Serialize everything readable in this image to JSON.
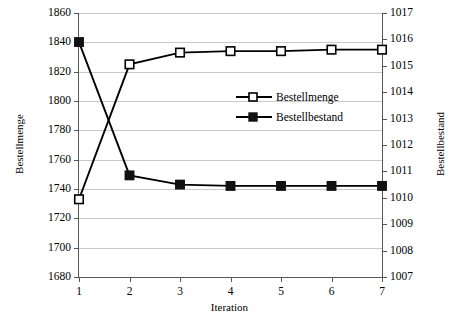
{
  "chart_data": {
    "type": "line",
    "title": "",
    "xlabel": "Iteration",
    "ylabel": "Bestellmenge",
    "y2label": "Bestellbestand",
    "x": [
      1,
      2,
      3,
      4,
      5,
      6,
      7
    ],
    "xtick_labels": [
      "1",
      "2",
      "3",
      "4",
      "5",
      "6",
      "7"
    ],
    "xlim": [
      1,
      7
    ],
    "ylim": [
      1680,
      1860
    ],
    "ytick_labels": [
      "1680",
      "1700",
      "1720",
      "1740",
      "1760",
      "1780",
      "1800",
      "1820",
      "1840",
      "1860"
    ],
    "ytick_values": [
      1680,
      1700,
      1720,
      1740,
      1760,
      1780,
      1800,
      1820,
      1840,
      1860
    ],
    "y2lim": [
      1007,
      1017
    ],
    "y2tick_labels": [
      "1007",
      "1008",
      "1009",
      "1010",
      "1011",
      "1012",
      "1013",
      "1014",
      "1015",
      "1016",
      "1017"
    ],
    "y2tick_values": [
      1007,
      1008,
      1009,
      1010,
      1011,
      1012,
      1013,
      1014,
      1015,
      1016,
      1017
    ],
    "grid": true,
    "legend_position": "inside-center",
    "series": [
      {
        "name": "Bestellmenge",
        "axis": "left",
        "marker": "open-square",
        "color": "#000000",
        "values": [
          1733,
          1825,
          1833,
          1834,
          1834,
          1835,
          1835
        ]
      },
      {
        "name": "Bestellbestand",
        "axis": "right",
        "marker": "filled-square",
        "color": "#000000",
        "values": [
          1015.9,
          1010.85,
          1010.5,
          1010.45,
          1010.45,
          1010.45,
          1010.45
        ]
      }
    ]
  },
  "legend": {
    "items": [
      {
        "label": "Bestellmenge"
      },
      {
        "label": "Bestellbestand"
      }
    ]
  }
}
